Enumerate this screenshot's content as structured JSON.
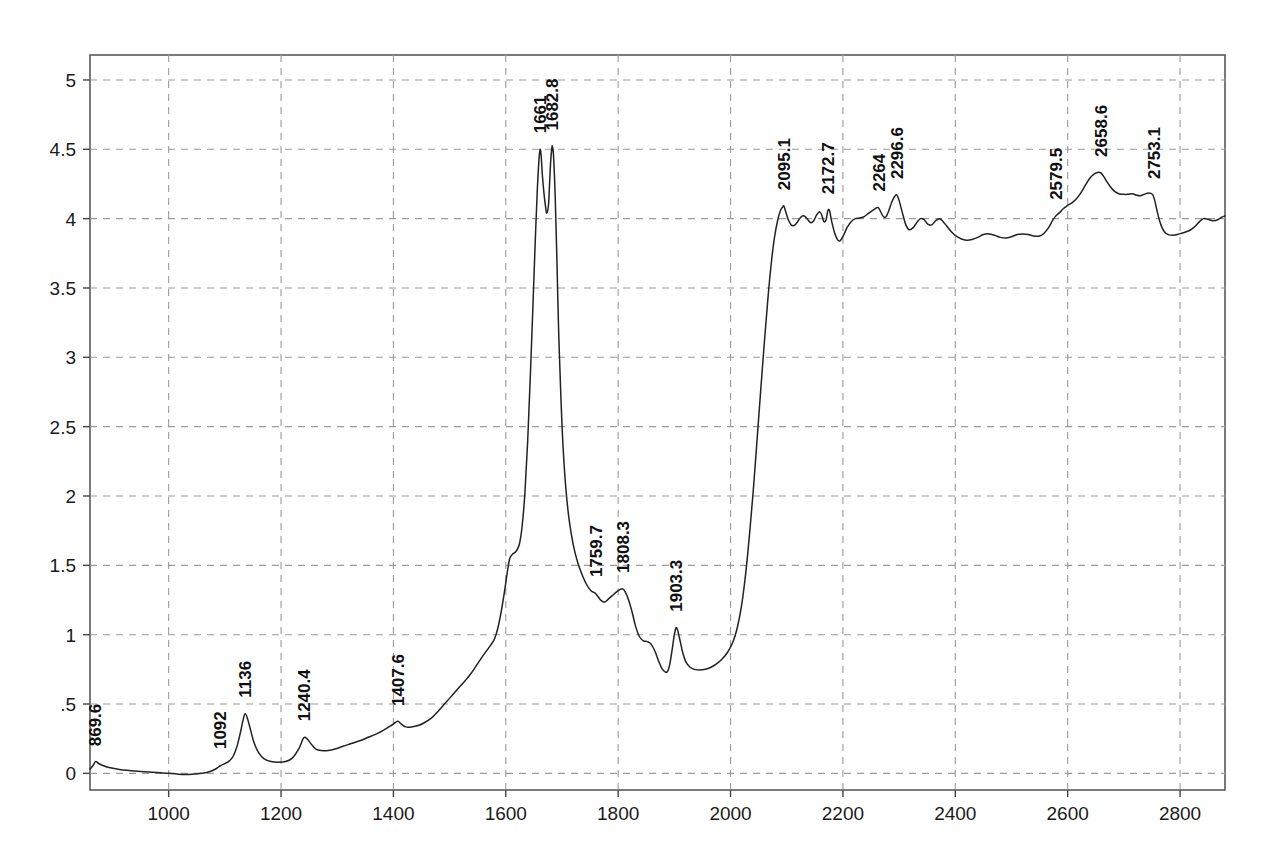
{
  "chart_data": {
    "type": "line",
    "title": "",
    "subtitle": "",
    "xlabel": "",
    "ylabel": "",
    "xlim": [
      860,
      2880
    ],
    "ylim": [
      -0.12,
      5.18
    ],
    "grid": true,
    "legend": null,
    "x_ticks": [
      1000,
      1200,
      1400,
      1600,
      1800,
      2000,
      2200,
      2400,
      2600,
      2800
    ],
    "x_tick_labels": [
      "1000",
      "1200",
      "1400",
      "1600",
      "1800",
      "2000",
      "2200",
      "2400",
      "2600",
      "2800"
    ],
    "y_ticks": [
      0,
      0.5,
      1,
      1.5,
      2,
      2.5,
      3,
      3.5,
      4,
      4.5,
      5
    ],
    "y_tick_labels": [
      "0",
      ".5",
      "1",
      "1.5",
      "2",
      "2.5",
      "3",
      "3.5",
      "4",
      "4.5",
      "5"
    ],
    "line_color": "#222222",
    "grid_color": "#9a9a9a",
    "axis_color": "#444444",
    "peak_labels": [
      {
        "label": "869.6",
        "x": 869.6,
        "y": 0.08
      },
      {
        "label": "1092",
        "x": 1092,
        "y": 0.06
      },
      {
        "label": "1136",
        "x": 1136,
        "y": 0.43
      },
      {
        "label": "1240.4",
        "x": 1240.4,
        "y": 0.26
      },
      {
        "label": "1407.6",
        "x": 1407.6,
        "y": 0.37
      },
      {
        "label": "1661",
        "x": 1661,
        "y": 4.5
      },
      {
        "label": "1682.8",
        "x": 1682.8,
        "y": 4.52
      },
      {
        "label": "1759.7",
        "x": 1759.7,
        "y": 1.3
      },
      {
        "label": "1808.3",
        "x": 1808.3,
        "y": 1.33
      },
      {
        "label": "1903.3",
        "x": 1903.3,
        "y": 1.05
      },
      {
        "label": "2095.1",
        "x": 2095.1,
        "y": 4.09
      },
      {
        "label": "2172.7",
        "x": 2172.7,
        "y": 4.06
      },
      {
        "label": "2264",
        "x": 2264,
        "y": 4.08
      },
      {
        "label": "2296.6",
        "x": 2296.6,
        "y": 4.17
      },
      {
        "label": "2579.5",
        "x": 2579.5,
        "y": 4.02
      },
      {
        "label": "2658.6",
        "x": 2658.6,
        "y": 4.33
      },
      {
        "label": "2753.1",
        "x": 2753.1,
        "y": 4.17
      }
    ],
    "series": [
      {
        "name": "spectrum",
        "points": [
          [
            860,
            0.03
          ],
          [
            866,
            0.06
          ],
          [
            870,
            0.085
          ],
          [
            876,
            0.07
          ],
          [
            884,
            0.055
          ],
          [
            896,
            0.04
          ],
          [
            910,
            0.03
          ],
          [
            925,
            0.022
          ],
          [
            945,
            0.015
          ],
          [
            965,
            0.01
          ],
          [
            985,
            0.005
          ],
          [
            1000,
            0.0
          ],
          [
            1015,
            -0.005
          ],
          [
            1030,
            -0.008
          ],
          [
            1045,
            -0.005
          ],
          [
            1060,
            0.0
          ],
          [
            1075,
            0.015
          ],
          [
            1085,
            0.035
          ],
          [
            1092,
            0.055
          ],
          [
            1100,
            0.07
          ],
          [
            1108,
            0.09
          ],
          [
            1115,
            0.125
          ],
          [
            1122,
            0.2
          ],
          [
            1128,
            0.3
          ],
          [
            1133,
            0.395
          ],
          [
            1136,
            0.43
          ],
          [
            1140,
            0.4
          ],
          [
            1146,
            0.31
          ],
          [
            1152,
            0.22
          ],
          [
            1160,
            0.15
          ],
          [
            1170,
            0.105
          ],
          [
            1182,
            0.085
          ],
          [
            1195,
            0.08
          ],
          [
            1208,
            0.085
          ],
          [
            1220,
            0.11
          ],
          [
            1232,
            0.18
          ],
          [
            1240,
            0.255
          ],
          [
            1246,
            0.25
          ],
          [
            1254,
            0.21
          ],
          [
            1262,
            0.175
          ],
          [
            1272,
            0.165
          ],
          [
            1284,
            0.165
          ],
          [
            1296,
            0.175
          ],
          [
            1310,
            0.195
          ],
          [
            1325,
            0.215
          ],
          [
            1340,
            0.235
          ],
          [
            1355,
            0.26
          ],
          [
            1370,
            0.285
          ],
          [
            1382,
            0.31
          ],
          [
            1394,
            0.34
          ],
          [
            1403,
            0.365
          ],
          [
            1408,
            0.375
          ],
          [
            1414,
            0.355
          ],
          [
            1422,
            0.335
          ],
          [
            1432,
            0.335
          ],
          [
            1444,
            0.345
          ],
          [
            1455,
            0.365
          ],
          [
            1468,
            0.4
          ],
          [
            1480,
            0.45
          ],
          [
            1492,
            0.505
          ],
          [
            1504,
            0.56
          ],
          [
            1516,
            0.615
          ],
          [
            1528,
            0.67
          ],
          [
            1538,
            0.72
          ],
          [
            1548,
            0.78
          ],
          [
            1558,
            0.84
          ],
          [
            1566,
            0.885
          ],
          [
            1574,
            0.93
          ],
          [
            1580,
            0.97
          ],
          [
            1586,
            1.05
          ],
          [
            1592,
            1.17
          ],
          [
            1598,
            1.32
          ],
          [
            1603,
            1.46
          ],
          [
            1607,
            1.55
          ],
          [
            1612,
            1.58
          ],
          [
            1618,
            1.6
          ],
          [
            1624,
            1.65
          ],
          [
            1629,
            1.78
          ],
          [
            1634,
            2.02
          ],
          [
            1639,
            2.4
          ],
          [
            1644,
            2.9
          ],
          [
            1649,
            3.45
          ],
          [
            1653,
            3.9
          ],
          [
            1656,
            4.2
          ],
          [
            1659,
            4.42
          ],
          [
            1661,
            4.5
          ],
          [
            1663,
            4.45
          ],
          [
            1665,
            4.32
          ],
          [
            1668,
            4.18
          ],
          [
            1671,
            4.08
          ],
          [
            1673,
            4.04
          ],
          [
            1676,
            4.1
          ],
          [
            1678,
            4.26
          ],
          [
            1680,
            4.42
          ],
          [
            1682,
            4.51
          ],
          [
            1683,
            4.52
          ],
          [
            1685,
            4.45
          ],
          [
            1688,
            4.15
          ],
          [
            1691,
            3.7
          ],
          [
            1694,
            3.2
          ],
          [
            1698,
            2.72
          ],
          [
            1702,
            2.35
          ],
          [
            1707,
            2.05
          ],
          [
            1713,
            1.82
          ],
          [
            1720,
            1.65
          ],
          [
            1728,
            1.52
          ],
          [
            1736,
            1.43
          ],
          [
            1744,
            1.36
          ],
          [
            1752,
            1.315
          ],
          [
            1759,
            1.3
          ],
          [
            1764,
            1.275
          ],
          [
            1770,
            1.245
          ],
          [
            1776,
            1.235
          ],
          [
            1782,
            1.255
          ],
          [
            1789,
            1.28
          ],
          [
            1796,
            1.305
          ],
          [
            1803,
            1.325
          ],
          [
            1808,
            1.33
          ],
          [
            1813,
            1.305
          ],
          [
            1819,
            1.245
          ],
          [
            1825,
            1.16
          ],
          [
            1831,
            1.06
          ],
          [
            1838,
            0.985
          ],
          [
            1845,
            0.955
          ],
          [
            1852,
            0.95
          ],
          [
            1859,
            0.93
          ],
          [
            1866,
            0.875
          ],
          [
            1872,
            0.81
          ],
          [
            1878,
            0.755
          ],
          [
            1884,
            0.73
          ],
          [
            1888,
            0.735
          ],
          [
            1892,
            0.79
          ],
          [
            1896,
            0.89
          ],
          [
            1900,
            1.0
          ],
          [
            1903,
            1.05
          ],
          [
            1906,
            1.03
          ],
          [
            1910,
            0.96
          ],
          [
            1915,
            0.87
          ],
          [
            1921,
            0.8
          ],
          [
            1928,
            0.765
          ],
          [
            1936,
            0.75
          ],
          [
            1945,
            0.745
          ],
          [
            1955,
            0.75
          ],
          [
            1965,
            0.765
          ],
          [
            1975,
            0.79
          ],
          [
            1985,
            0.825
          ],
          [
            1995,
            0.875
          ],
          [
            2004,
            0.945
          ],
          [
            2012,
            1.05
          ],
          [
            2020,
            1.22
          ],
          [
            2028,
            1.48
          ],
          [
            2035,
            1.78
          ],
          [
            2042,
            2.12
          ],
          [
            2048,
            2.45
          ],
          [
            2054,
            2.78
          ],
          [
            2060,
            3.1
          ],
          [
            2066,
            3.4
          ],
          [
            2072,
            3.66
          ],
          [
            2078,
            3.86
          ],
          [
            2084,
            3.99
          ],
          [
            2089,
            4.06
          ],
          [
            2093,
            4.085
          ],
          [
            2095,
            4.09
          ],
          [
            2099,
            4.04
          ],
          [
            2103,
            3.99
          ],
          [
            2108,
            3.955
          ],
          [
            2113,
            3.95
          ],
          [
            2118,
            3.97
          ],
          [
            2123,
            4.0
          ],
          [
            2128,
            4.02
          ],
          [
            2133,
            4.015
          ],
          [
            2138,
            3.99
          ],
          [
            2143,
            3.97
          ],
          [
            2148,
            3.985
          ],
          [
            2153,
            4.025
          ],
          [
            2158,
            4.05
          ],
          [
            2162,
            4.03
          ],
          [
            2166,
            3.98
          ],
          [
            2170,
            3.99
          ],
          [
            2173,
            4.055
          ],
          [
            2176,
            4.06
          ],
          [
            2180,
            3.98
          ],
          [
            2185,
            3.9
          ],
          [
            2190,
            3.85
          ],
          [
            2195,
            3.84
          ],
          [
            2201,
            3.88
          ],
          [
            2208,
            3.94
          ],
          [
            2215,
            3.98
          ],
          [
            2222,
            4.0
          ],
          [
            2230,
            4.005
          ],
          [
            2238,
            4.015
          ],
          [
            2246,
            4.04
          ],
          [
            2255,
            4.065
          ],
          [
            2262,
            4.08
          ],
          [
            2266,
            4.06
          ],
          [
            2271,
            4.02
          ],
          [
            2276,
            4.01
          ],
          [
            2281,
            4.05
          ],
          [
            2287,
            4.12
          ],
          [
            2292,
            4.16
          ],
          [
            2296,
            4.17
          ],
          [
            2300,
            4.13
          ],
          [
            2306,
            4.04
          ],
          [
            2312,
            3.955
          ],
          [
            2318,
            3.92
          ],
          [
            2325,
            3.935
          ],
          [
            2332,
            3.975
          ],
          [
            2338,
            4.0
          ],
          [
            2344,
            3.995
          ],
          [
            2351,
            3.96
          ],
          [
            2358,
            3.955
          ],
          [
            2365,
            3.985
          ],
          [
            2372,
            4.0
          ],
          [
            2378,
            3.98
          ],
          [
            2385,
            3.945
          ],
          [
            2393,
            3.905
          ],
          [
            2401,
            3.875
          ],
          [
            2410,
            3.855
          ],
          [
            2420,
            3.845
          ],
          [
            2430,
            3.85
          ],
          [
            2440,
            3.865
          ],
          [
            2450,
            3.885
          ],
          [
            2460,
            3.89
          ],
          [
            2470,
            3.88
          ],
          [
            2480,
            3.865
          ],
          [
            2490,
            3.86
          ],
          [
            2500,
            3.87
          ],
          [
            2510,
            3.885
          ],
          [
            2520,
            3.89
          ],
          [
            2530,
            3.885
          ],
          [
            2540,
            3.875
          ],
          [
            2550,
            3.875
          ],
          [
            2558,
            3.895
          ],
          [
            2566,
            3.935
          ],
          [
            2573,
            3.985
          ],
          [
            2579,
            4.02
          ],
          [
            2586,
            4.045
          ],
          [
            2593,
            4.075
          ],
          [
            2600,
            4.095
          ],
          [
            2608,
            4.115
          ],
          [
            2616,
            4.145
          ],
          [
            2624,
            4.19
          ],
          [
            2632,
            4.245
          ],
          [
            2640,
            4.295
          ],
          [
            2648,
            4.325
          ],
          [
            2655,
            4.335
          ],
          [
            2659,
            4.33
          ],
          [
            2664,
            4.305
          ],
          [
            2670,
            4.265
          ],
          [
            2677,
            4.225
          ],
          [
            2684,
            4.195
          ],
          [
            2691,
            4.18
          ],
          [
            2699,
            4.175
          ],
          [
            2707,
            4.175
          ],
          [
            2715,
            4.18
          ],
          [
            2722,
            4.17
          ],
          [
            2729,
            4.165
          ],
          [
            2736,
            4.175
          ],
          [
            2744,
            4.185
          ],
          [
            2751,
            4.175
          ],
          [
            2755,
            4.13
          ],
          [
            2760,
            4.04
          ],
          [
            2766,
            3.955
          ],
          [
            2772,
            3.905
          ],
          [
            2779,
            3.885
          ],
          [
            2787,
            3.88
          ],
          [
            2795,
            3.885
          ],
          [
            2803,
            3.895
          ],
          [
            2811,
            3.905
          ],
          [
            2819,
            3.92
          ],
          [
            2827,
            3.945
          ],
          [
            2835,
            3.98
          ],
          [
            2842,
            4.0
          ],
          [
            2850,
            3.995
          ],
          [
            2858,
            3.985
          ],
          [
            2866,
            3.99
          ],
          [
            2874,
            4.01
          ],
          [
            2880,
            4.02
          ]
        ]
      }
    ]
  }
}
